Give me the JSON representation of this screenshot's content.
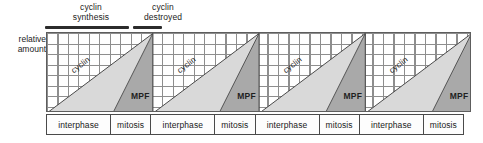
{
  "figure": {
    "axis_label_line1": "relative",
    "axis_label_line2": "amount"
  },
  "annotations": [
    {
      "id": "cyclin-synthesis",
      "line1": "cyclin",
      "line2": "synthesis",
      "bar": "long"
    },
    {
      "id": "cyclin-destroyed",
      "line1": "cyclin",
      "line2": "destroyed",
      "bar": "short"
    }
  ],
  "series_labels": {
    "cyclin": "cyclin",
    "mpf": "MPF"
  },
  "phases": {
    "interphase": "interphase",
    "mitosis": "mitosis"
  },
  "phase_row": [
    {
      "label": "interphase",
      "cycle": 1
    },
    {
      "label": "mitosis",
      "cycle": 1
    },
    {
      "label": "interphase",
      "cycle": 2
    },
    {
      "label": "mitosis",
      "cycle": 2
    },
    {
      "label": "interphase",
      "cycle": 3
    },
    {
      "label": "mitosis",
      "cycle": 3
    },
    {
      "label": "interphase",
      "cycle": 4
    },
    {
      "label": "mitosis",
      "cycle": 4
    }
  ],
  "colors": {
    "cyclin_fill": "#d9d9d9",
    "mpf_fill": "#a9a9a9",
    "outline": "#4a4a4a",
    "grid": "#8e8e8e",
    "bar": "#2b2b2b",
    "text": "#1c1c1c",
    "background": "#ffffff"
  },
  "chart_data": {
    "type": "area",
    "xlabel": "",
    "ylabel": "relative amount",
    "ylim": [
      0,
      100
    ],
    "xlim": [
      0,
      4
    ],
    "grid": true,
    "legend": "inline-labels",
    "cycles": 4,
    "cycle_length": 1,
    "series": [
      {
        "name": "cyclin",
        "color": "#d9d9d9",
        "x": [
          0.0,
          1.0,
          1.0,
          1.0,
          2.0,
          2.0,
          2.0,
          3.0,
          3.0,
          3.0,
          4.0,
          4.0
        ],
        "values": [
          0,
          100,
          0,
          0,
          100,
          0,
          0,
          100,
          0,
          0,
          100,
          0
        ]
      },
      {
        "name": "MPF",
        "color": "#a9a9a9",
        "x": [
          0.62,
          1.0,
          1.0,
          1.62,
          2.0,
          2.0,
          2.62,
          3.0,
          3.0,
          3.62,
          4.0,
          4.0
        ],
        "values": [
          0,
          100,
          0,
          0,
          100,
          0,
          0,
          100,
          0,
          0,
          100,
          0
        ]
      }
    ],
    "x_phase_bands": [
      {
        "phase": "interphase",
        "start": 0.0,
        "end": 0.615
      },
      {
        "phase": "mitosis",
        "start": 0.615,
        "end": 1.0
      },
      {
        "phase": "interphase",
        "start": 1.0,
        "end": 1.615
      },
      {
        "phase": "mitosis",
        "start": 1.615,
        "end": 2.0
      },
      {
        "phase": "interphase",
        "start": 2.0,
        "end": 2.615
      },
      {
        "phase": "mitosis",
        "start": 2.615,
        "end": 3.0
      },
      {
        "phase": "interphase",
        "start": 3.0,
        "end": 3.615
      },
      {
        "phase": "mitosis",
        "start": 3.615,
        "end": 4.0
      }
    ],
    "annotations": [
      {
        "text": "cyclin synthesis",
        "x_start": 0.0,
        "x_end": 0.79,
        "position": "above-axis"
      },
      {
        "text": "cyclin destroyed",
        "x_start": 0.82,
        "x_end": 1.09,
        "position": "above-axis"
      }
    ]
  }
}
